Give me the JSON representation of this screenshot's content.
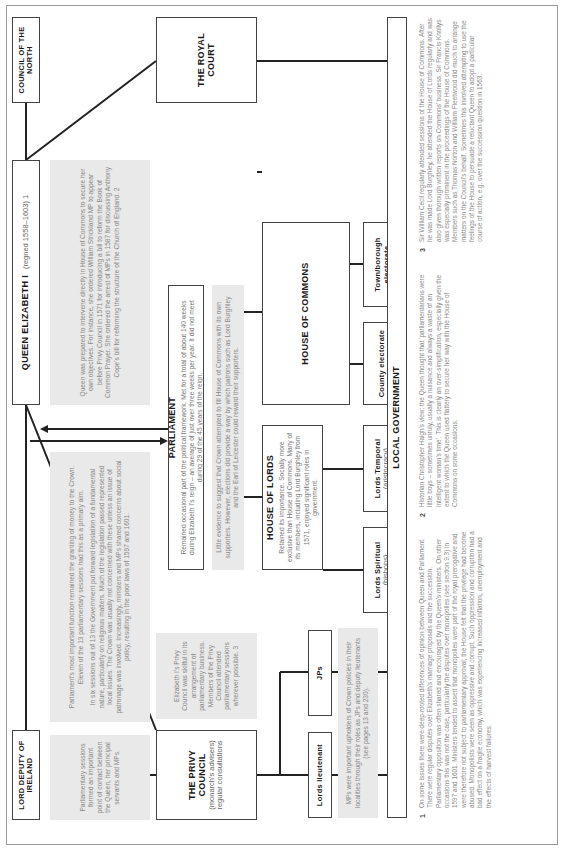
{
  "diagram": {
    "council_north": {
      "title": "COUNCIL OF THE NORTH"
    },
    "queen": {
      "title": "QUEEN ELIZABETH I",
      "subtitle": "(regned 1558–1603) 1"
    },
    "lord_deputy": {
      "title": "LORD DEPUTY OF IRELAND"
    },
    "royal_court": {
      "title": "THE ROYAL COURT"
    },
    "privy_council": {
      "title": "THE PRIVY COUNCIL",
      "subtitle": "(monarch's advisers) regular consultations"
    },
    "parliament": {
      "title": "PARLIAMENT",
      "description": "Remained occasional part of the political framework. Met for a total of about 140 weeks during Elizabeth I's reign – an average of just over three weeks per year. It did not meet during 29 of the 45 years of the reign."
    },
    "house_of_commons": {
      "title": "HOUSE OF COMMONS"
    },
    "house_of_lords": {
      "title": "HOUSE OF LORDS",
      "description": "Retained its importance. Socially more exclusive than House of Commons. Many of its members, including Lord Burghley from 1571, enjoyed significant roles in government."
    },
    "town_borough": {
      "title": "Town/borough electorate"
    },
    "county": {
      "title": "County electorate"
    },
    "lords_temporal": {
      "title": "Lords Temporal",
      "subtitle": "(aristocracy)"
    },
    "lords_spiritual": {
      "title": "Lords Spiritual",
      "subtitle": "(bishops)"
    },
    "jps": {
      "title": "JPs"
    },
    "lords_lieutenant": {
      "title": "Lords lieutenant"
    },
    "local_government": {
      "title": "LOCAL GOVERNMENT"
    }
  },
  "notes": {
    "queen_intervene": "Queen was prepared to intervene directly in House of Commons to secure her own objectives. For instance, she ordered William Strickland MP to appear before Privy Council in 1571 for introducing a bill to reform the Book of Common Prayer. She ordered the arrest of MPs in 1587 for discussing Anthony Cope's bill for reforming the structure of the Church of England. 2",
    "parliament_function_1": "Parliament's most important function remained the granting of money to the Crown. Eleven of the 13 parliamentary sessions had this as a primary aim.",
    "parliament_function_2": "In six sessions out of 13 the Government put forward legislation of a fundamental nature, particularly on religious matters. Much of the legislation passed represented local issues. The Crown was usually not concerned with these unless an issue of patronage was involved. Increasingly, ministers and MPs shared concerns about social policy, resulting in the poor laws of 1597 and 1601.",
    "crown_fill": "Little evidence to suggest that Crown attempted to fill House of Commons with its own supporters. However, elections did provide a way by which patrons such as Lord Burghley and the Earl of Leicester could reward their supporters.",
    "sessions_contact": "Parliamentary sessions formed an important point of contact between the Queen, her principal servants and MPs.",
    "privy_skill": "Elizabeth I's Privy Council was skilful in its arrangement of parliamentary business. Members of the Privy Council attended parliamentary sessions wherever possible. 3",
    "mps_upholders": "MPs were important upholders of Crown policies in their localities through their roles as JPs and deputy lieutenants (see pages 13 and 230)."
  },
  "footnotes": [
    {
      "num": "1",
      "text": "On some issues there were deep-rooted differences of opinion between Queen and Parliament. There were regular disputes over Elizabeth's marriage proposals and the succession. Parliamentary opposition was often shared and encouraged by the Queen's ministers. On other occasions this was not the case, particularly the disputes over monopolies (see section 9.3) in 1597 and 1601. Ministers tended to assert that monopolies were part of the royal prerogative and were therefore not subject to parliamentary approval; the House felt that the privilege had become abused. Monopolists were seen as oppressive and corrupt. Such oppression and corruption had a bad effect on a fragile economy, which was experiencing increased inflation, unemployment and the effects of harvest failures."
    },
    {
      "num": "2",
      "text": "Historian Christopher Haigh's view: the Queen thought that 'parliamentarians were little boys – sometimes unruly, usually a nuisance and always a waste of an intelligent woman's time'. This is clearly an over-simplification, especially given the extent to which the Queen used flattery to secure her way with the House of Commons on some occasions."
    },
    {
      "num": "3",
      "text": "Sir William Cecil regularly attended sessions of the House of Commons. After he was made Lord Burghley, he attended the House of Lords regularly and was also given thorough written reports on Commons' business. Sir Francis Knollys was especially prominent in the proceedings of the House of Commons. Members such as Thomas Norton and William Fleetwood did much to arrange matters on the Council's behalf. Sometimes this involved attempting to use the feelings of the House to persuade a reluctant Queen to adopt a particular course of action, e.g. over the succession question in 1563."
    }
  ],
  "colors": {
    "line": "#222222",
    "note_bg": "#e9e9e9",
    "border": "#444444"
  }
}
